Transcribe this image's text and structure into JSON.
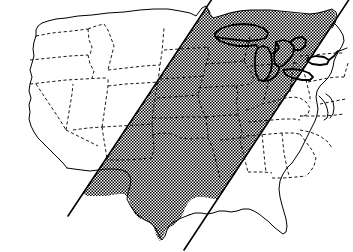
{
  "figure": {
    "kind": "reference-map",
    "width": 353,
    "height": 252,
    "background_color": "#ffffff",
    "has_text_labels": false,
    "caption": ""
  },
  "legend_items": [
    {
      "name": "shaded-band",
      "label": "Shaded corridor (stipple fill)",
      "color": "#000000",
      "pattern": "checkerboard-stipple"
    },
    {
      "name": "state-border",
      "label": "State boundary",
      "color": "#000000",
      "style": "dashed"
    },
    {
      "name": "national-border",
      "label": "National / coastal outline",
      "color": "#000000",
      "style": "solid"
    },
    {
      "name": "great-lakes",
      "label": "Great Lakes shoreline",
      "color": "#000000",
      "style": "heavy-solid"
    }
  ],
  "style": {
    "outline_color": "#000000",
    "state_border_color": "#000000",
    "stipple_color": "#000000",
    "stipple_background": "#ffffff",
    "band_line_color": "#000000",
    "outline_width": 1.0,
    "state_border_width": 0.9,
    "band_line_width": 1.6,
    "lake_outline_width": 1.8,
    "stipple_cell_px": 2
  },
  "band": {
    "name": "diagonal-corridor",
    "orientation": "southwest-to-northeast",
    "left_edge": {
      "x1": 68,
      "y1": 216,
      "x2": 214,
      "y2": -4
    },
    "right_edge": {
      "x1": 184,
      "y1": 250,
      "x2": 350,
      "y2": -2
    },
    "fill": "stipple",
    "edge_line_color": "#000000"
  },
  "map_paths": {
    "national_outline": "M 34,72 L 33,80 L 30,88 L 31,96 L 28,104 L 30,112 L 27,120 L 29,128 L 33,134 L 37,139 L 42,143 L 48,148 L 53,153 L 58,158 L 62,165 L 66,172 L 70,178 L 74,184 L 78,190 L 82,194 L 88,196 L 96,196 L 104,196 L 112,196 L 120,195 L 127,195 L 131,198 L 133,204 L 135,210 L 138,215 L 141,219 L 145,221 L 150,222 L 154,225 L 156,231 L 159,236 L 162,240 L 166,239 L 168,234 L 170,228 L 173,224 L 177,222 L 182,220 L 186,217 L 190,214 L 194,212 L 198,213 L 203,214 L 208,213 L 213,211 L 218,210 L 223,211 L 228,212 L 233,211 L 238,209 L 243,208 L 249,209 L 254,211 L 258,214 L 262,218 L 266,222 L 270,227 L 274,231 L 278,234 L 282,233 L 284,228 L 284,221 L 283,214 L 281,206 L 279,198 L 278,190 L 279,182 L 281,175 L 284,169 L 288,163 L 292,158 L 296,152 L 299,146 L 302,140 L 304,133 L 306,126 L 309,119 L 312,113 L 315,107 L 318,101 L 320,95 L 322,88 L 324,81 L 327,74 L 330,68 L 333,62 L 336,56 L 339,50 L 342,44 L 344,38 L 346,31 L 347,24 L 346,17 L 343,11 L 339,7 L 334,5 L 328,6 L 323,9 L 318,13 L 313,17 L 308,20 L 303,22 L 298,21 L 293,19 L 288,17 L 283,15 L 278,14 L 272,13 L 266,12 L 260,12 L 254,12 L 248,12 L 242,12 L 236,12 L 230,12 L 224,13 L 218,14 L 212,15 L 206,16 L 200,17 L 194,18 L 188,19 L 182,20 L 176,21 L 170,22 L 164,23 L 158,23 L 152,23 L 146,23 L 140,23 L 134,23 L 128,24 L 122,25 L 116,26 L 110,27 L 104,28 L 98,29 L 92,30 L 86,31 L 80,32 L 74,33 L 68,34 L 62,35 L 56,36 L 50,37 L 46,40 L 44,46 L 43,52 L 41,58 L 38,64 L 36,68 Z",
    "note": "simplified outline of the contiguous United States"
  },
  "geography": {
    "regions_inside_band": [
      "Texas",
      "Oklahoma",
      "Kansas",
      "Nebraska",
      "Iowa",
      "Missouri",
      "Arkansas",
      "Louisiana",
      "Mississippi",
      "Alabama",
      "Tennessee",
      "Kentucky",
      "Illinois",
      "Indiana",
      "Ohio",
      "Michigan",
      "Wisconsin",
      "Minnesota",
      "South Dakota",
      "North Dakota",
      "West Virginia",
      "Pennsylvania",
      "New York"
    ],
    "regions_outside_band_west": [
      "Washington",
      "Oregon",
      "California",
      "Idaho",
      "Nevada",
      "Utah",
      "Arizona",
      "Montana",
      "Wyoming",
      "Colorado",
      "New Mexico"
    ],
    "regions_outside_band_east": [
      "Virginia",
      "North Carolina",
      "South Carolina",
      "Georgia",
      "Florida",
      "Maryland",
      "Delaware",
      "New Jersey",
      "New England"
    ],
    "great_lakes": [
      "Superior",
      "Michigan",
      "Huron",
      "Erie",
      "Ontario"
    ]
  }
}
